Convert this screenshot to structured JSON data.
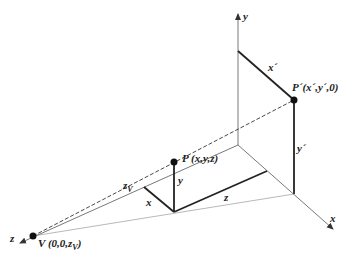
{
  "diagram": {
    "type": "perspective-projection",
    "axes": {
      "x_label": "x",
      "y_label": "y",
      "z_label": "z"
    },
    "points": {
      "P": {
        "label": "P (x,y,z)"
      },
      "P_prime": {
        "label": "P´(x´,y´,0)"
      },
      "V": {
        "label": "V (0,0,z",
        "sub": "V",
        "close": ")"
      }
    },
    "segment_labels": {
      "x": "x",
      "y": "y",
      "z": "z",
      "x_prime": "x´",
      "y_prime": "y´",
      "z_v": "z",
      "z_v_sub": "V"
    },
    "colors": {
      "line": "#333333",
      "thick": "#222222",
      "thin": "#777777"
    }
  }
}
